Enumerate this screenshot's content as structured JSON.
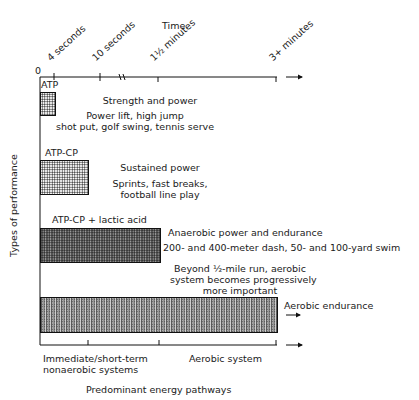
{
  "diagram": {
    "top_axis": {
      "title": "Time",
      "origin": "0",
      "ticks": [
        "4 seconds",
        "10 seconds",
        "1½ minutes",
        "3+ minutes"
      ]
    },
    "y_axis_label": "Types of performance",
    "rows": [
      {
        "system": "ATP",
        "type": "Strength and power",
        "examples": [
          "Power lift, high jump",
          "shot put, golf swing, tennis serve"
        ]
      },
      {
        "system": "ATP-CP",
        "type": "Sustained power",
        "examples": [
          "Sprints, fast breaks,",
          "football line play"
        ]
      },
      {
        "system": "ATP-CP + lactic acid",
        "type": "Anaerobic power and endurance",
        "examples": [
          "200- and 400-meter dash, 50- and 100-yard swim"
        ]
      },
      {
        "system": "",
        "type": "Aerobic endurance",
        "note": [
          "Beyond ½-mile run, aerobic",
          "system becomes progressively",
          "more important"
        ]
      }
    ],
    "bottom_axis": {
      "left_label": [
        "Immediate/short-term",
        "nonaerobic systems"
      ],
      "right_label": "Aerobic system",
      "title": "Predominant energy pathways"
    }
  }
}
